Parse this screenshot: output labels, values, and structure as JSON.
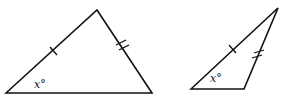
{
  "diagram": {
    "type": "geometry",
    "triangles": [
      {
        "id": "left",
        "angle_label": "x°",
        "tick_marks": [
          {
            "side": "left",
            "count": 1
          },
          {
            "side": "right",
            "count": 2
          }
        ]
      },
      {
        "id": "right",
        "angle_label": "x°",
        "tick_marks": [
          {
            "side": "left",
            "count": 1
          },
          {
            "side": "right",
            "count": 2
          }
        ]
      }
    ]
  }
}
